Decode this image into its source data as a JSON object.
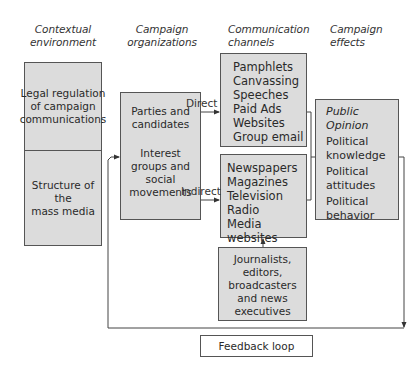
{
  "headers": {
    "contextual": [
      "Contextual",
      "environment"
    ],
    "organizations": [
      "Campaign",
      "organizations"
    ],
    "channels": [
      "Communication",
      "channels"
    ],
    "effects": [
      "Campaign",
      "effects"
    ]
  },
  "contextual_environment": {
    "top": [
      "Legal regulation",
      "of campaign",
      "communications"
    ],
    "bottom": [
      "Structure of the",
      "mass media"
    ]
  },
  "campaign_organizations": {
    "group1": [
      "Parties and",
      "candidates"
    ],
    "group2": [
      "Interest",
      "groups and",
      "social",
      "movements"
    ]
  },
  "arrows": {
    "direct": "Direct",
    "indirect": "Indirect"
  },
  "direct_channels": [
    "Pamphlets",
    "Canvassing",
    "Speeches",
    "Paid Ads",
    "Websites",
    "Group email"
  ],
  "indirect_channels": [
    "Newspapers",
    "Magazines",
    "Television",
    "Radio",
    "Media websites"
  ],
  "journalists": [
    "Journalists,",
    "editors,",
    "broadcasters",
    "and news",
    "executives"
  ],
  "campaign_effects": {
    "title": "Public Opinion",
    "items": [
      [
        "Political",
        "knowledge"
      ],
      [
        "Political",
        "attitudes"
      ],
      [
        "Political",
        "behavior"
      ]
    ]
  },
  "feedback": {
    "label": "Feedback loop"
  },
  "colors": {
    "box_fill": "#dcdcdc",
    "line": "#444444",
    "text": "#2a2a2a"
  }
}
